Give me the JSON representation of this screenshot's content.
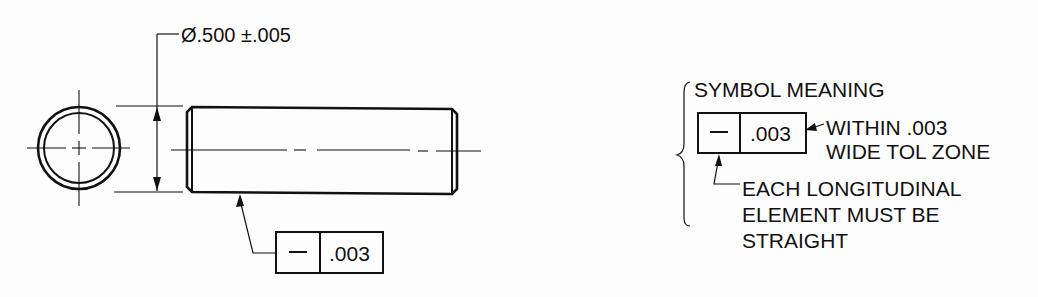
{
  "figure": {
    "type": "geometric-tolerancing-straightness-example",
    "colors": {
      "background": "#fdfdfd",
      "ink": "#111111"
    }
  },
  "views": {
    "end_view": {
      "label": "end view of cylindrical pin",
      "center_lines": true
    },
    "side_view": {
      "label": "side view of cylindrical pin",
      "diameter_dimension": {
        "symbol": "Ø",
        "value": ".500",
        "tolerance": "±.005",
        "text": "Ø.500 ±.005"
      }
    }
  },
  "feature_control_frame": {
    "symbol_name": "straightness",
    "symbol_glyph": "—",
    "tolerance": ".003"
  },
  "legend": {
    "title": "SYMBOL MEANING",
    "frame": {
      "symbol_glyph": "—",
      "tolerance": ".003"
    },
    "tolerance_note": {
      "lines": [
        "WITHIN .003",
        "WIDE TOL ZONE"
      ]
    },
    "symbol_note": {
      "lines": [
        "EACH LONGITUDINAL",
        "ELEMENT MUST BE",
        "STRAIGHT"
      ]
    }
  }
}
